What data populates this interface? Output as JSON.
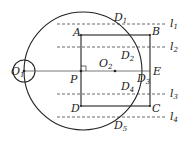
{
  "diagram": {
    "type": "geometry",
    "colors": {
      "stroke": "#222222",
      "dashed": "#444444",
      "background": "#ffffff"
    },
    "big_circle": {
      "center_label": "O",
      "center_sub": "2",
      "cx": 83,
      "cy": 71,
      "r": 59
    },
    "small_circle": {
      "center_label": "O",
      "center_sub": "1",
      "cx": 24,
      "cy": 71,
      "r": 11
    },
    "rectangle": {
      "vertices": [
        {
          "label": "A",
          "x": 81,
          "y": 35
        },
        {
          "label": "B",
          "x": 150,
          "y": 35
        },
        {
          "label": "C",
          "x": 150,
          "y": 106
        },
        {
          "label": "D",
          "x": 81,
          "y": 106
        }
      ]
    },
    "points": [
      {
        "label": "P",
        "sub": "",
        "x": 81,
        "y": 71
      },
      {
        "label": "O",
        "sub": "2",
        "x": 115,
        "y": 71
      },
      {
        "label": "E",
        "sub": "",
        "x": 150,
        "y": 71
      }
    ],
    "intersections": [
      {
        "label": "D",
        "sub": "1"
      },
      {
        "label": "D",
        "sub": "2"
      },
      {
        "label": "D",
        "sub": "3"
      },
      {
        "label": "D",
        "sub": "4"
      },
      {
        "label": "D",
        "sub": "5"
      }
    ],
    "dashed_lines": [
      {
        "label": "l",
        "sub": "1",
        "y": 24
      },
      {
        "label": "l",
        "sub": "2",
        "y": 47
      },
      {
        "label": "l",
        "sub": "3",
        "y": 94
      },
      {
        "label": "l",
        "sub": "4",
        "y": 117
      }
    ],
    "right_angle_marker_at": "P"
  }
}
